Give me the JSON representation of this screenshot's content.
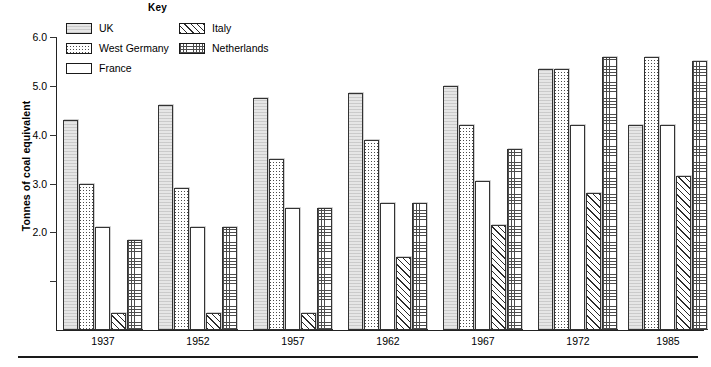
{
  "key": {
    "title": "Key",
    "items": [
      {
        "label": "UK",
        "pattern": "solid-light-gray",
        "series_key": "UK"
      },
      {
        "label": "West Germany",
        "pattern": "stippled-dots",
        "series_key": "West Germany"
      },
      {
        "label": "France",
        "pattern": "white-blank",
        "series_key": "France"
      },
      {
        "label": "Italy",
        "pattern": "diagonal-hatch",
        "series_key": "Italy"
      },
      {
        "label": "Netherlands",
        "pattern": "fine-grid-dots",
        "series_key": "Netherlands"
      }
    ]
  },
  "axis": {
    "y_title": "Tonnes of coal equivalent",
    "y_ticks": [
      {
        "value": 6.0,
        "label": "6.0"
      },
      {
        "value": 5.0,
        "label": "5.0"
      },
      {
        "value": 4.0,
        "label": "4.0"
      },
      {
        "value": 3.0,
        "label": "3.0"
      },
      {
        "value": 2.0,
        "label": "2.0"
      },
      {
        "value": 1.0,
        "label": ""
      }
    ]
  },
  "chart_data": {
    "type": "bar",
    "title": "",
    "subtitle": "",
    "xlabel": "",
    "ylabel": "Tonnes of coal equivalent",
    "ylim": [
      0,
      6.0
    ],
    "grid": false,
    "legend_position": "top-center",
    "legend_title": "Key",
    "categories": [
      "1937",
      "1952",
      "1957",
      "1962",
      "1967",
      "1972",
      "1985"
    ],
    "series": [
      {
        "name": "UK",
        "values": [
          4.3,
          4.6,
          4.75,
          4.85,
          5.0,
          5.35,
          4.2
        ]
      },
      {
        "name": "West Germany",
        "values": [
          3.0,
          2.9,
          3.5,
          3.9,
          4.2,
          5.35,
          5.6
        ]
      },
      {
        "name": "France",
        "values": [
          2.1,
          2.1,
          2.5,
          2.6,
          3.05,
          4.2,
          4.2
        ]
      },
      {
        "name": "Italy",
        "values": [
          0.35,
          0.35,
          0.35,
          1.5,
          2.15,
          2.8,
          3.15
        ]
      },
      {
        "name": "Netherlands",
        "values": [
          1.85,
          2.1,
          2.5,
          2.6,
          3.7,
          5.6,
          5.5
        ]
      }
    ]
  }
}
